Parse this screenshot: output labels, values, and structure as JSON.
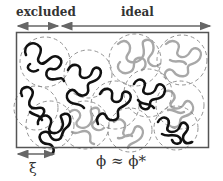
{
  "diagram": {
    "title_labels": {
      "excluded": "excluded",
      "ideal": "ideal"
    },
    "bottom_labels": {
      "blob_size": "ξ",
      "concentration": "ϕ ≈ ϕ*"
    },
    "colors": {
      "frame": "#555555",
      "arrow": "#666666",
      "dark_chain": "#111111",
      "light_chain": "#a8a8a8",
      "blob_outline": "#888888",
      "text": "#333333"
    },
    "blobs": [
      {
        "cx": 45,
        "cy": 62,
        "r": 25,
        "shade": "dark"
      },
      {
        "cx": 88,
        "cy": 74,
        "r": 24,
        "shade": "dark"
      },
      {
        "cx": 135,
        "cy": 60,
        "r": 26,
        "shade": "light"
      },
      {
        "cx": 182,
        "cy": 60,
        "r": 25,
        "shade": "light"
      },
      {
        "cx": 36,
        "cy": 108,
        "r": 22,
        "shade": "dark"
      },
      {
        "cx": 50,
        "cy": 125,
        "r": 24,
        "shade": "dark"
      },
      {
        "cx": 85,
        "cy": 125,
        "r": 24,
        "shade": "light"
      },
      {
        "cx": 115,
        "cy": 105,
        "r": 24,
        "shade": "dark"
      },
      {
        "cx": 148,
        "cy": 93,
        "r": 24,
        "shade": "dark"
      },
      {
        "cx": 180,
        "cy": 105,
        "r": 24,
        "shade": "light"
      },
      {
        "cx": 130,
        "cy": 130,
        "r": 22,
        "shade": "light"
      },
      {
        "cx": 176,
        "cy": 128,
        "r": 22,
        "shade": "dark"
      }
    ]
  }
}
